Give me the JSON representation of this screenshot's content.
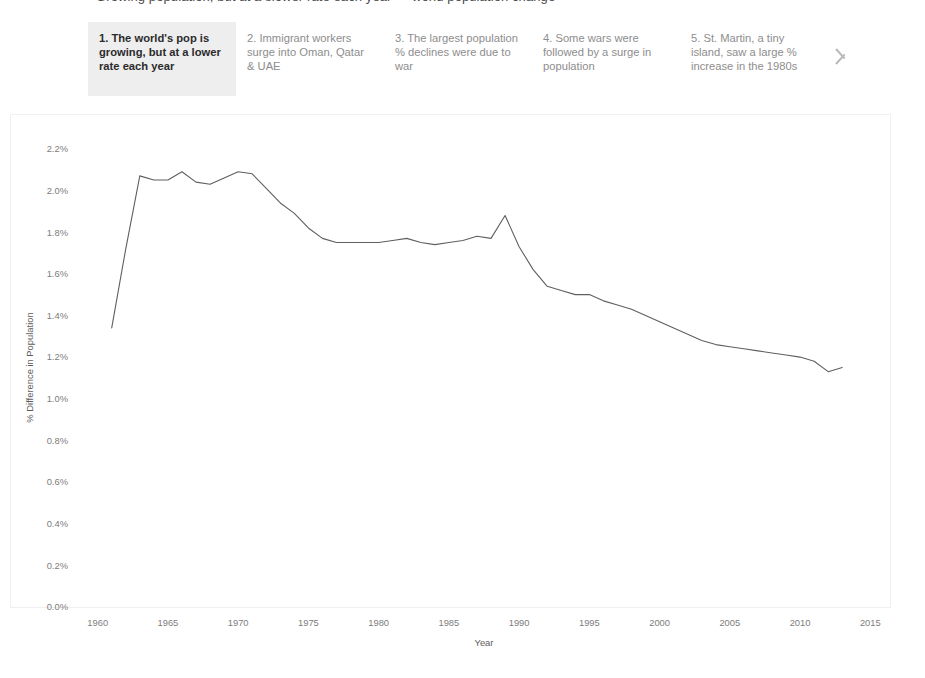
{
  "header": {
    "clipped_title": "Growing population, but at a slower rate each year — world population change"
  },
  "story_tabs": {
    "selected_index": 0,
    "next_arrow_icon": "chevron-right-icon",
    "items": [
      {
        "label": "1. The world's pop is growing, but at a lower rate each year",
        "selected": true
      },
      {
        "label": "2. Immigrant workers surge into Oman, Qatar & UAE",
        "selected": false
      },
      {
        "label": "3. The largest population % declines were due to war",
        "selected": false
      },
      {
        "label": "4. Some wars were followed by a surge in population",
        "selected": false
      },
      {
        "label": "5. St. Martin, a tiny island, saw a large % increase in the 1980s",
        "selected": false
      }
    ]
  },
  "colors": {
    "line": "#5f5f5f",
    "selected_tab_background": "#eeeeee",
    "tab_text": "#8d8d8d",
    "selected_tab_text": "#2b2b2b",
    "axis_text": "#7d7d7d",
    "plot_border": "#f0f0f0",
    "page_background": "#ffffff"
  },
  "chart_data": {
    "type": "line",
    "title": "",
    "xlabel": "Year",
    "ylabel": "% Difference in Population",
    "xlim": [
      1958.6,
      2016.4
    ],
    "ylim": [
      0.0,
      2.3
    ],
    "grid": false,
    "legend": "none",
    "x_ticks": [
      1960,
      1965,
      1970,
      1975,
      1980,
      1985,
      1990,
      1995,
      2000,
      2005,
      2010,
      2015
    ],
    "x_tick_labels": [
      "1960",
      "1965",
      "1970",
      "1975",
      "1980",
      "1985",
      "1990",
      "1995",
      "2000",
      "2005",
      "2010",
      "2015"
    ],
    "y_ticks": [
      0.0,
      0.2,
      0.4,
      0.6,
      0.8,
      1.0,
      1.2,
      1.4,
      1.6,
      1.8,
      2.0,
      2.2
    ],
    "y_tick_labels": [
      "0.0%",
      "0.2%",
      "0.4%",
      "0.6%",
      "0.8%",
      "1.0%",
      "1.2%",
      "1.4%",
      "1.6%",
      "1.8%",
      "2.0%",
      "2.2%"
    ],
    "series": [
      {
        "name": "% Difference in Population",
        "color": "#5f5f5f",
        "x": [
          1961,
          1962,
          1963,
          1964,
          1965,
          1966,
          1967,
          1968,
          1969,
          1970,
          1971,
          1972,
          1973,
          1974,
          1975,
          1976,
          1977,
          1978,
          1979,
          1980,
          1981,
          1982,
          1983,
          1984,
          1985,
          1986,
          1987,
          1988,
          1989,
          1990,
          1991,
          1992,
          1993,
          1994,
          1995,
          1996,
          1997,
          1998,
          1999,
          2000,
          2001,
          2002,
          2003,
          2004,
          2005,
          2006,
          2007,
          2008,
          2009,
          2010,
          2011,
          2012,
          2013
        ],
        "values": [
          1.34,
          1.72,
          2.07,
          2.05,
          2.05,
          2.09,
          2.04,
          2.03,
          2.06,
          2.09,
          2.08,
          2.01,
          1.94,
          1.89,
          1.82,
          1.77,
          1.75,
          1.75,
          1.75,
          1.75,
          1.76,
          1.77,
          1.75,
          1.74,
          1.75,
          1.76,
          1.78,
          1.77,
          1.88,
          1.73,
          1.62,
          1.54,
          1.52,
          1.5,
          1.5,
          1.47,
          1.45,
          1.43,
          1.4,
          1.37,
          1.34,
          1.31,
          1.28,
          1.26,
          1.25,
          1.24,
          1.23,
          1.22,
          1.21,
          1.2,
          1.18,
          1.13,
          1.15
        ]
      }
    ],
    "annotations": {
      "start_year": 1961,
      "start_value": 1.34,
      "peak_value": 2.09,
      "peak_years": [
        1966,
        1970
      ],
      "spike_year": 1989,
      "spike_value": 1.88,
      "end_year": 2013,
      "end_value": 1.15
    }
  }
}
